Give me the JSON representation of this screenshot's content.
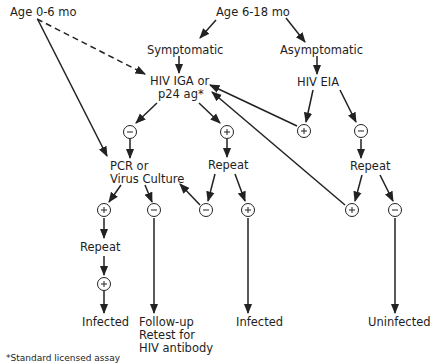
{
  "diagram": {
    "type": "flowchart",
    "title": "",
    "nodes": {
      "age_0_6": "Age 0-6 mo",
      "age_6_18": "Age 6-18 mo",
      "symptomatic": "Symptomatic",
      "asymptomatic": "Asymptomatic",
      "hiv_iga_line1": "HIV IGA or",
      "hiv_iga_line2": "p24 ag*",
      "hiv_eia": "HIV EIA",
      "pcr_line1": "PCR or",
      "pcr_line2": "Virus Culture",
      "repeat_left": "Repeat",
      "repeat_mid": "Repeat",
      "repeat_right": "Repeat",
      "infected_left": "Infected",
      "followup_line1": "Follow-up",
      "followup_line2": "Retest for",
      "followup_line3": "HIV antibody",
      "infected_mid": "Infected",
      "uninfected": "Uninfected"
    },
    "result_signs": {
      "positive": "+",
      "negative": "−"
    },
    "edges": [
      {
        "from": "Age 0-6 mo",
        "to": "HIV IGA or p24 ag*",
        "style": "dashed"
      },
      {
        "from": "Age 0-6 mo",
        "to": "PCR or Virus Culture",
        "style": "solid"
      },
      {
        "from": "Age 6-18 mo",
        "to": "Symptomatic"
      },
      {
        "from": "Age 6-18 mo",
        "to": "Asymptomatic"
      },
      {
        "from": "Symptomatic",
        "to": "HIV IGA or p24 ag*"
      },
      {
        "from": "Asymptomatic",
        "to": "HIV EIA"
      },
      {
        "from": "HIV IGA or p24 ag*",
        "to": "−"
      },
      {
        "from": "HIV IGA or p24 ag*",
        "to": "+"
      },
      {
        "from": "HIV EIA",
        "to": "+",
        "then": "HIV IGA or p24 ag*"
      },
      {
        "from": "HIV EIA",
        "to": "−",
        "then": "Repeat"
      },
      {
        "from": "− (IGA)",
        "to": "PCR or Virus Culture"
      },
      {
        "from": "+ (IGA)",
        "to": "Repeat"
      },
      {
        "from": "Repeat (mid)",
        "to": "−",
        "then": "PCR or Virus Culture"
      },
      {
        "from": "Repeat (mid)",
        "to": "+",
        "then": "Infected"
      },
      {
        "from": "Repeat (right)",
        "to": "+",
        "then": "HIV IGA or p24 ag*"
      },
      {
        "from": "Repeat (right)",
        "to": "−",
        "then": "Uninfected"
      },
      {
        "from": "PCR or Virus Culture",
        "to": "+",
        "then": "Repeat"
      },
      {
        "from": "PCR or Virus Culture",
        "to": "−",
        "then": "Follow-up Retest for HIV antibody"
      },
      {
        "from": "Repeat (left)",
        "to": "+",
        "then": "Infected"
      }
    ],
    "footnote": "*Standard licensed assay"
  }
}
